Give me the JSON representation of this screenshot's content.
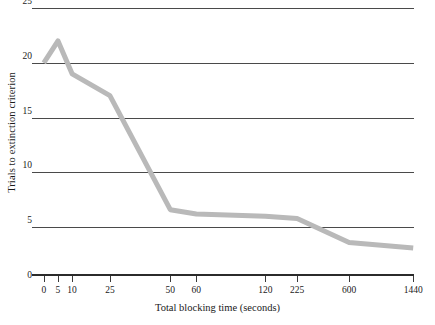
{
  "chart_data": {
    "type": "line",
    "title": "",
    "xlabel": "Total blocking time (seconds)",
    "ylabel": "Trials to extinction criterion",
    "categories": [
      "0",
      "5",
      "10",
      "25",
      "50",
      "60",
      "120",
      "225",
      "600",
      "1440"
    ],
    "x_tick_labels": [
      "0",
      "5",
      "10",
      "25",
      "50",
      "60",
      "120",
      "225",
      "600",
      "1440"
    ],
    "y_tick_labels": [
      "0",
      "5",
      "10",
      "15",
      "20",
      "25"
    ],
    "ylim": [
      0,
      25
    ],
    "grid": "horizontal",
    "legend": "none",
    "series": [
      {
        "name": "Trials to extinction criterion",
        "color": "#b9b9b9",
        "values": [
          20,
          22,
          19,
          17,
          6.6,
          6.2,
          6,
          5.8,
          3.6,
          3.1
        ]
      }
    ]
  },
  "axis": {
    "y_title": "Trials to extinction criterion",
    "x_title": "Total blocking time (seconds)",
    "y_ticks": [
      {
        "label": "25",
        "value": 25
      },
      {
        "label": "20",
        "value": 20
      },
      {
        "label": "15",
        "value": 15
      },
      {
        "label": "10",
        "value": 10
      },
      {
        "label": "5",
        "value": 5
      },
      {
        "label": "0",
        "value": 0
      }
    ],
    "x_ticks": [
      {
        "label": "0"
      },
      {
        "label": "5"
      },
      {
        "label": "10"
      },
      {
        "label": "25"
      },
      {
        "label": "50"
      },
      {
        "label": "60"
      },
      {
        "label": "120"
      },
      {
        "label": "225"
      },
      {
        "label": "600"
      },
      {
        "label": "1440"
      }
    ]
  },
  "colors": {
    "line": "#b9b9b9",
    "gridline": "#4a4a4a",
    "axis": "#2b2b2b",
    "text": "#1a1a1a",
    "background": "#ffffff"
  }
}
